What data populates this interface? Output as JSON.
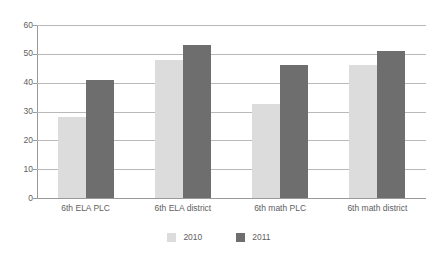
{
  "chart_data": {
    "type": "bar",
    "title": "",
    "subtitle": "",
    "xlabel": "",
    "ylabel": "",
    "ylim": [
      0,
      60
    ],
    "y_ticks": [
      0,
      10,
      20,
      30,
      40,
      50,
      60
    ],
    "grid": true,
    "legend_position": "bottom",
    "categories": [
      "6th ELA PLC",
      "6th ELA district",
      "6th math PLC",
      "6th math district"
    ],
    "series": [
      {
        "name": "2010",
        "color": "#dcdcdc",
        "values": [
          28,
          48,
          32.5,
          46
        ]
      },
      {
        "name": "2011",
        "color": "#6e6e6e",
        "values": [
          41,
          53,
          46,
          51
        ]
      }
    ]
  },
  "colors": {
    "background": "#ffffff",
    "gridline": "#b9b9b9",
    "axis": "#9a9a9a",
    "text": "#5e5e5e",
    "series_2010": "#dcdcdc",
    "series_2011": "#6e6e6e"
  }
}
